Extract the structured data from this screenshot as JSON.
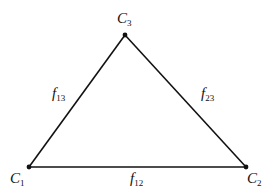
{
  "diagram": {
    "type": "triangle-graph",
    "nodes": [
      {
        "id": "C1",
        "label": "C",
        "sub": "1",
        "x": 29,
        "y": 167,
        "lx": 10,
        "ly": 183
      },
      {
        "id": "C2",
        "label": "C",
        "sub": "2",
        "x": 246,
        "y": 167,
        "lx": 247,
        "ly": 183
      },
      {
        "id": "C3",
        "label": "C",
        "sub": "3",
        "x": 125,
        "y": 35,
        "lx": 117,
        "ly": 23
      }
    ],
    "edges": [
      {
        "from": "C1",
        "to": "C2",
        "label": "f",
        "sub": "12",
        "lx": 130,
        "ly": 183
      },
      {
        "from": "C1",
        "to": "C3",
        "label": "f",
        "sub": "13",
        "lx": 52,
        "ly": 98
      },
      {
        "from": "C3",
        "to": "C2",
        "label": "f",
        "sub": "23",
        "lx": 201,
        "ly": 98
      }
    ],
    "colors": {
      "line": "#111111",
      "background": "#ffffff"
    }
  }
}
